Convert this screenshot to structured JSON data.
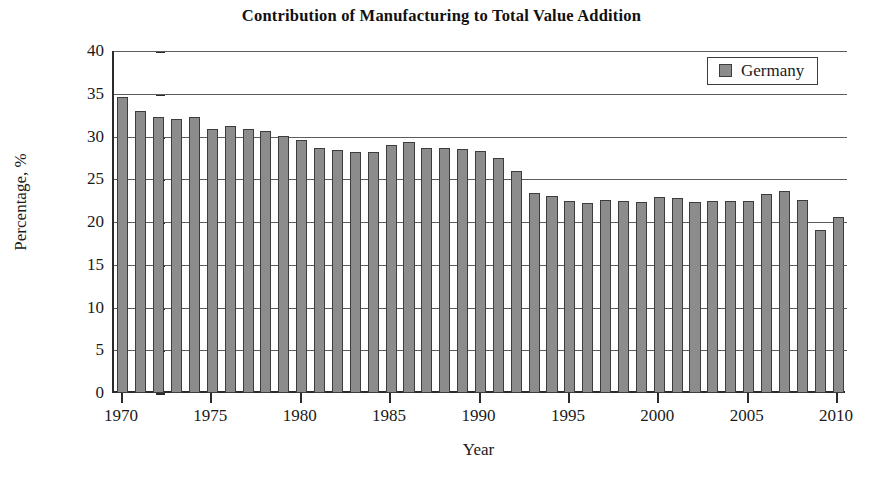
{
  "chart_data": {
    "type": "bar",
    "title": "Contribution of Manufacturing to Total Value Addition",
    "xlabel": "Year",
    "ylabel": "Percentage, %",
    "ylim": [
      0,
      40
    ],
    "ytick_step": 5,
    "yticks": [
      0,
      5,
      10,
      15,
      20,
      25,
      30,
      35,
      40
    ],
    "ytick_labels": [
      "0",
      "5",
      "10",
      "15",
      "20",
      "25",
      "30",
      "35",
      "40"
    ],
    "xlim": [
      1969.5,
      2010.5
    ],
    "xticks": [
      1970,
      1975,
      1980,
      1985,
      1990,
      1995,
      2000,
      2005,
      2010
    ],
    "xtick_labels": [
      "1970",
      "1975",
      "1980",
      "1985",
      "1990",
      "1995",
      "2000",
      "2005",
      "2010"
    ],
    "grid": "horizontal",
    "legend_position": "top-right",
    "legend": [
      "Germany"
    ],
    "series": [
      {
        "name": "Germany",
        "color": "#8c8c8c",
        "edge_color": "#3d3d3d",
        "categories": [
          1970,
          1971,
          1972,
          1973,
          1974,
          1975,
          1976,
          1977,
          1978,
          1979,
          1980,
          1981,
          1982,
          1983,
          1984,
          1985,
          1986,
          1987,
          1988,
          1989,
          1990,
          1991,
          1992,
          1993,
          1994,
          1995,
          1996,
          1997,
          1998,
          1999,
          2000,
          2001,
          2002,
          2003,
          2004,
          2005,
          2006,
          2007,
          2008,
          2009,
          2010
        ],
        "values": [
          34.6,
          33.0,
          32.3,
          32.1,
          32.3,
          30.9,
          31.2,
          30.9,
          30.7,
          30.1,
          29.6,
          28.6,
          28.4,
          28.2,
          28.2,
          29.0,
          29.4,
          28.6,
          28.6,
          28.5,
          28.3,
          27.5,
          26.0,
          23.4,
          23.0,
          22.4,
          22.2,
          22.6,
          22.5,
          22.3,
          22.9,
          22.8,
          22.3,
          22.4,
          22.4,
          22.5,
          23.3,
          23.6,
          22.6,
          19.1,
          20.6
        ]
      }
    ]
  }
}
